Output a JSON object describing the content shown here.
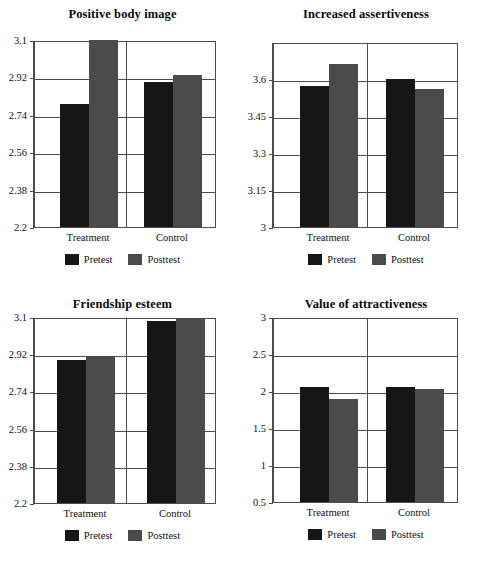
{
  "figure": {
    "background": "#ffffff",
    "series_colors": {
      "pretest": "#161616",
      "posttest": "#4b4b4b"
    },
    "legend_labels": {
      "pretest": "Pretest",
      "posttest": "Posttest"
    },
    "categories": [
      "Treatment",
      "Control"
    ]
  },
  "chart_data": [
    {
      "type": "bar",
      "title": "Positive body image",
      "xlabel": "",
      "ylabel": "",
      "categories": [
        "Treatment",
        "Control"
      ],
      "series": [
        {
          "name": "Pretest",
          "values": [
            2.79,
            2.9
          ]
        },
        {
          "name": "Posttest",
          "values": [
            3.1,
            2.93
          ]
        }
      ],
      "ylim": [
        2.2,
        3.1
      ],
      "yticks": [
        "3.1",
        "2.92",
        "2.74",
        "2.56",
        "2.38",
        "2.2"
      ],
      "ytick_values": [
        3.1,
        2.92,
        2.74,
        2.56,
        2.38,
        2.2
      ],
      "grid": true,
      "legend": "bottom-center"
    },
    {
      "type": "bar",
      "title": "Increased assertiveness",
      "xlabel": "",
      "ylabel": "",
      "categories": [
        "Treatment",
        "Control"
      ],
      "series": [
        {
          "name": "Pretest",
          "values": [
            3.57,
            3.6
          ]
        },
        {
          "name": "Posttest",
          "values": [
            3.66,
            3.56
          ]
        }
      ],
      "ylim": [
        3.0,
        3.75
      ],
      "yticks": [
        "3.6",
        "3.45",
        "3.3",
        "3.15",
        "3"
      ],
      "ytick_values": [
        3.6,
        3.45,
        3.3,
        3.15,
        3.0
      ],
      "grid": true,
      "legend": "bottom-center"
    },
    {
      "type": "bar",
      "title": "Friendship esteem",
      "xlabel": "",
      "ylabel": "",
      "categories": [
        "Treatment",
        "Control"
      ],
      "series": [
        {
          "name": "Pretest",
          "values": [
            2.89,
            3.08
          ]
        },
        {
          "name": "Posttest",
          "values": [
            2.91,
            3.095
          ]
        }
      ],
      "ylim": [
        2.2,
        3.1
      ],
      "yticks": [
        "3.1",
        "2.92",
        "2.74",
        "2.56",
        "2.38",
        "2.2"
      ],
      "ytick_values": [
        3.1,
        2.92,
        2.74,
        2.56,
        2.38,
        2.2
      ],
      "grid": true,
      "legend": "bottom-center"
    },
    {
      "type": "bar",
      "title": "Value of attractiveness",
      "xlabel": "",
      "ylabel": "",
      "categories": [
        "Treatment",
        "Control"
      ],
      "series": [
        {
          "name": "Pretest",
          "values": [
            2.06,
            2.06
          ]
        },
        {
          "name": "Posttest",
          "values": [
            1.89,
            2.03
          ]
        }
      ],
      "ylim": [
        0.5,
        3.0
      ],
      "yticks": [
        "3",
        "2.5",
        "2",
        "1.5",
        "1",
        "0.5"
      ],
      "ytick_values": [
        3.0,
        2.5,
        2.0,
        1.5,
        1.0,
        0.5
      ],
      "grid": true,
      "legend": "bottom-center"
    }
  ]
}
